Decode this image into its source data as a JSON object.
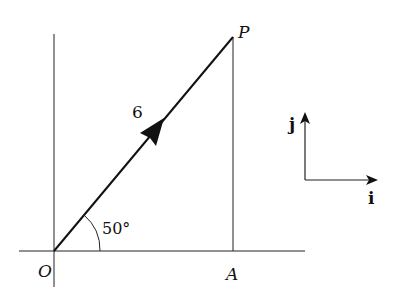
{
  "diagram": {
    "origin_label": "O",
    "point_p_label": "P",
    "point_a_label": "A",
    "magnitude_label": "6",
    "angle_label": "50°",
    "unit_i_label": "i",
    "unit_j_label": "j",
    "colors": {
      "line": "#111111",
      "background": "#ffffff"
    }
  }
}
